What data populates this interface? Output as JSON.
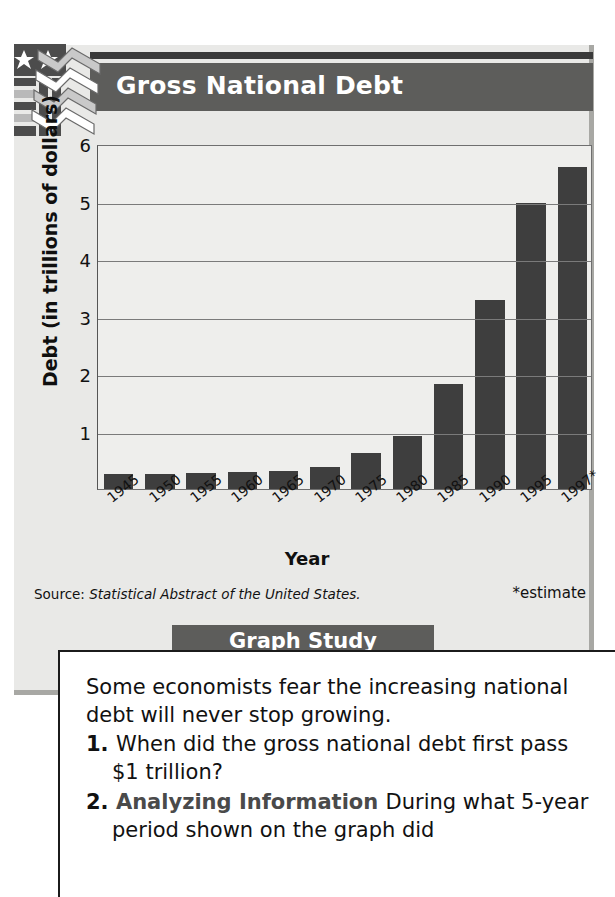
{
  "header": {
    "title": "Gross National Debt",
    "logo_icon": "usa-flag-chevron-icon"
  },
  "chart_data": {
    "type": "bar",
    "title": "Gross National Debt",
    "xlabel": "Year",
    "ylabel": "Debt (in trillions of dollars)",
    "categories": [
      "1945",
      "1950",
      "1955",
      "1960",
      "1965",
      "1970",
      "1975",
      "1980",
      "1985",
      "1990",
      "1995",
      "1997*"
    ],
    "values": [
      0.26,
      0.26,
      0.27,
      0.29,
      0.32,
      0.38,
      0.63,
      0.92,
      1.82,
      3.28,
      4.97,
      5.6
    ],
    "ylim": [
      0,
      6
    ],
    "yticks": [
      1,
      2,
      3,
      4,
      5,
      6
    ],
    "ytick_labels": [
      "1",
      "2",
      "3",
      "4",
      "5",
      "6"
    ],
    "grid": true,
    "legend": "none",
    "bar_color": "#3e3e3e",
    "plot_background": "#eeeeec",
    "source_prefix": "Source: ",
    "source_italic": "Statistical Abstract of the United States.",
    "footnote": "*estimate"
  },
  "graph_study": {
    "tab_label": "Graph Study",
    "lead": "Some economists fear the increasing national debt will never stop growing.",
    "items": [
      {
        "number": "1.",
        "skill": "",
        "text": "When did the gross national debt first pass $1 trillion?"
      },
      {
        "number": "2.",
        "skill": "Analyzing Information",
        "text": "During what 5-year period shown on the graph did"
      }
    ]
  },
  "colors": {
    "panel": "#e9e9e7",
    "titlebar": "#5d5d5b",
    "bar": "#3e3e3e",
    "text": "#111111"
  }
}
